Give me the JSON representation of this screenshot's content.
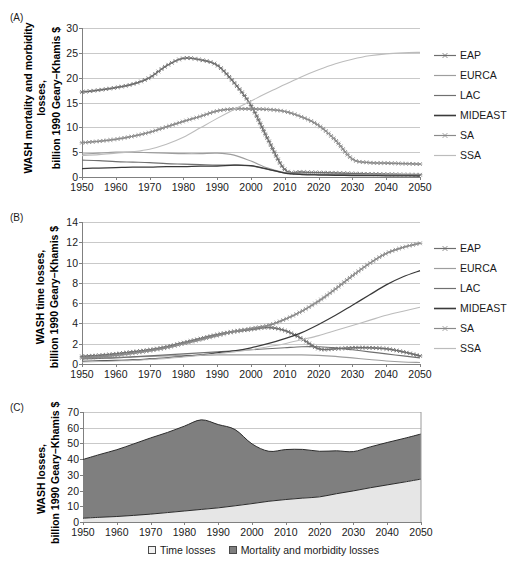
{
  "figure": {
    "panels": [
      "(A)",
      "(B)",
      "(C)"
    ]
  },
  "chart_data": [
    {
      "panel": "(A)",
      "type": "line",
      "title": "",
      "xlabel": "",
      "ylabel": "WASH mortality and morbidity losses, billion 1990 Geary–Khamis $",
      "ylabel_line1": "WASH mortality and morbidity",
      "ylabel_line2": "losses,",
      "ylabel_line3": "billion 1990 Geary–Khamis $",
      "xlim": [
        1950,
        2050
      ],
      "ylim": [
        0,
        30
      ],
      "yticks": [
        0,
        5,
        10,
        15,
        20,
        25,
        30
      ],
      "xticks": [
        1950,
        1960,
        1970,
        1980,
        1990,
        2000,
        2010,
        2020,
        2030,
        2040,
        2050
      ],
      "grid": true,
      "legend_position": "right",
      "x": [
        1950,
        1955,
        1960,
        1965,
        1970,
        1975,
        1980,
        1985,
        1990,
        1995,
        2000,
        2005,
        2010,
        2015,
        2020,
        2025,
        2030,
        2035,
        2040,
        2045,
        2050
      ],
      "series": [
        {
          "name": "EAP",
          "color": "#6e6e6e",
          "marker": "star",
          "values": [
            17.1,
            17.5,
            18.0,
            18.7,
            20.0,
            22.4,
            23.9,
            23.6,
            22.5,
            19.0,
            14.4,
            7.6,
            1.5,
            1.0,
            0.9,
            0.8,
            0.7,
            0.6,
            0.55,
            0.5,
            0.45
          ]
        },
        {
          "name": "EURCA",
          "color": "#9e9e9e",
          "marker": "none",
          "values": [
            4.6,
            4.8,
            5.0,
            5.0,
            4.9,
            4.8,
            4.7,
            4.7,
            4.8,
            4.4,
            3.2,
            1.8,
            0.9,
            0.7,
            0.6,
            0.55,
            0.5,
            0.5,
            0.45,
            0.45,
            0.4
          ]
        },
        {
          "name": "LAC",
          "color": "#707070",
          "marker": "none",
          "values": [
            3.4,
            3.3,
            3.1,
            3.0,
            2.9,
            2.7,
            2.6,
            2.5,
            2.4,
            2.4,
            2.2,
            1.5,
            0.8,
            0.55,
            0.5,
            0.45,
            0.4,
            0.4,
            0.35,
            0.35,
            0.3
          ]
        },
        {
          "name": "MIDEAST",
          "color": "#3a3a3a",
          "marker": "none",
          "values": [
            1.7,
            1.8,
            1.9,
            2.0,
            2.0,
            2.1,
            2.1,
            2.2,
            2.2,
            2.4,
            2.3,
            1.6,
            0.8,
            0.5,
            0.4,
            0.35,
            0.3,
            0.3,
            0.25,
            0.25,
            0.2
          ]
        },
        {
          "name": "SA",
          "color": "#8a8a8a",
          "marker": "star",
          "values": [
            6.9,
            7.2,
            7.6,
            8.2,
            9.0,
            10.1,
            11.2,
            12.2,
            13.3,
            13.7,
            13.7,
            13.6,
            13.2,
            12.1,
            10.4,
            7.4,
            3.6,
            2.9,
            2.8,
            2.7,
            2.6
          ]
        },
        {
          "name": "SSA",
          "color": "#bcbcbc",
          "marker": "none",
          "values": [
            4.3,
            4.5,
            4.8,
            5.1,
            5.6,
            6.6,
            8.0,
            9.9,
            11.8,
            13.6,
            15.3,
            17.0,
            18.6,
            20.2,
            21.6,
            22.8,
            23.7,
            24.4,
            24.8,
            25.0,
            25.1
          ]
        }
      ]
    },
    {
      "panel": "(B)",
      "type": "line",
      "title": "",
      "xlabel": "",
      "ylabel": "WASH time losses, billion 1990 Geary–Khamis $",
      "ylabel_line1": "WASH time losses,",
      "ylabel_line2": "billion 1990 Geary–Khamis $",
      "xlim": [
        1950,
        2050
      ],
      "ylim": [
        0,
        14
      ],
      "yticks": [
        0,
        2,
        4,
        6,
        8,
        10,
        12,
        14
      ],
      "xticks": [
        1950,
        1960,
        1970,
        1980,
        1990,
        2000,
        2010,
        2020,
        2030,
        2040,
        2050
      ],
      "grid": true,
      "legend_position": "right",
      "x": [
        1950,
        1955,
        1960,
        1965,
        1970,
        1975,
        1980,
        1985,
        1990,
        1995,
        2000,
        2005,
        2010,
        2015,
        2020,
        2025,
        2030,
        2035,
        2040,
        2045,
        2050
      ],
      "series": [
        {
          "name": "EAP",
          "color": "#6e6e6e",
          "marker": "star",
          "values": [
            0.75,
            0.85,
            1.0,
            1.2,
            1.4,
            1.7,
            2.1,
            2.5,
            2.9,
            3.2,
            3.4,
            3.6,
            3.3,
            2.5,
            1.5,
            1.5,
            1.6,
            1.6,
            1.5,
            1.2,
            0.8
          ]
        },
        {
          "name": "EURCA",
          "color": "#9e9e9e",
          "marker": "none",
          "values": [
            0.55,
            0.6,
            0.65,
            0.7,
            0.75,
            0.8,
            0.85,
            0.85,
            0.9,
            0.9,
            0.9,
            0.9,
            0.9,
            0.9,
            0.85,
            0.75,
            0.6,
            0.45,
            0.3,
            0.2,
            0.15
          ]
        },
        {
          "name": "LAC",
          "color": "#707070",
          "marker": "none",
          "values": [
            0.5,
            0.55,
            0.6,
            0.7,
            0.8,
            0.9,
            1.0,
            1.1,
            1.2,
            1.3,
            1.4,
            1.5,
            1.6,
            1.7,
            1.7,
            1.6,
            1.4,
            1.2,
            1.0,
            0.8,
            0.6
          ]
        },
        {
          "name": "MIDEAST",
          "color": "#3a3a3a",
          "marker": "none",
          "values": [
            0.25,
            0.3,
            0.35,
            0.4,
            0.5,
            0.6,
            0.75,
            0.9,
            1.1,
            1.3,
            1.6,
            2.0,
            2.5,
            3.1,
            3.9,
            4.8,
            5.8,
            6.8,
            7.8,
            8.6,
            9.2
          ]
        },
        {
          "name": "SA",
          "color": "#8a8a8a",
          "marker": "star",
          "values": [
            0.6,
            0.7,
            0.85,
            1.05,
            1.3,
            1.6,
            2.0,
            2.4,
            2.8,
            3.2,
            3.5,
            3.8,
            4.4,
            5.2,
            6.2,
            7.4,
            8.7,
            9.9,
            10.9,
            11.5,
            11.9
          ]
        },
        {
          "name": "SSA",
          "color": "#bcbcbc",
          "marker": "none",
          "values": [
            0.2,
            0.25,
            0.3,
            0.35,
            0.45,
            0.55,
            0.7,
            0.85,
            1.0,
            1.2,
            1.4,
            1.7,
            2.0,
            2.4,
            2.8,
            3.3,
            3.8,
            4.3,
            4.8,
            5.2,
            5.6
          ]
        }
      ]
    },
    {
      "panel": "(C)",
      "type": "area",
      "title": "",
      "xlabel": "",
      "ylabel": "WASH losses, billion 1990 Geary–Khamis $",
      "ylabel_line1": "WASH losses,",
      "ylabel_line2": "billion 1990 Geary–Khamis $",
      "xlim": [
        1950,
        2050
      ],
      "ylim": [
        0,
        70
      ],
      "yticks": [
        0,
        10,
        20,
        30,
        40,
        50,
        60,
        70
      ],
      "xticks": [
        1950,
        1960,
        1970,
        1980,
        1990,
        2000,
        2010,
        2020,
        2030,
        2040,
        2050
      ],
      "grid": true,
      "stacked": true,
      "legend_position": "bottom",
      "x": [
        1950,
        1955,
        1960,
        1965,
        1970,
        1975,
        1980,
        1985,
        1990,
        1995,
        2000,
        2005,
        2010,
        2015,
        2020,
        2025,
        2030,
        2035,
        2040,
        2045,
        2050
      ],
      "series": [
        {
          "name": "Time losses",
          "color": "#e6e6e6",
          "values": [
            2.4,
            3.0,
            3.5,
            4.2,
            5.0,
            6.0,
            7.0,
            8.0,
            9.0,
            10.3,
            11.7,
            13.2,
            14.3,
            15.2,
            16.0,
            18.0,
            19.8,
            21.8,
            23.6,
            25.4,
            27.3
          ]
        },
        {
          "name": "Mortality and morbidity losses",
          "color": "#7f7f7f",
          "values": [
            37.4,
            40.0,
            42.5,
            45.5,
            48.5,
            51.0,
            54.0,
            57.0,
            53.0,
            48.5,
            38.0,
            31.8,
            31.8,
            31.0,
            29.0,
            27.3,
            25.0,
            26.0,
            27.0,
            27.8,
            28.7
          ]
        }
      ],
      "totals": [
        39.8,
        43.0,
        46.0,
        49.7,
        53.5,
        57.0,
        61.0,
        65.0,
        62.0,
        58.8,
        49.7,
        45.0,
        46.1,
        46.2,
        45.0,
        45.3,
        44.8,
        47.8,
        50.6,
        53.2,
        56.0
      ]
    }
  ],
  "panelC_legend": {
    "items": [
      {
        "label": "Time losses",
        "color": "#f2f2f2"
      },
      {
        "label": "Mortality and morbidity losses",
        "color": "#7f7f7f"
      }
    ]
  }
}
